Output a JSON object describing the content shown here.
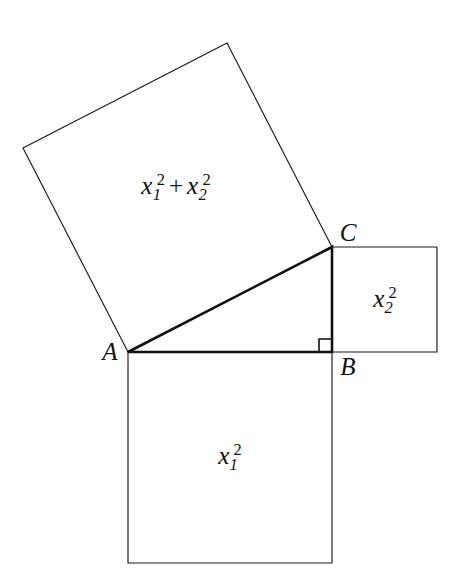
{
  "figure": {
    "background_color": "#ffffff",
    "line_color": "#1a1a1a",
    "width": 455,
    "height": 588
  },
  "vertices": {
    "a": {
      "label": "A",
      "x": 128,
      "y": 352,
      "label_x": 110,
      "label_y": 351
    },
    "b": {
      "label": "B",
      "x": 332,
      "y": 352,
      "label_x": 348,
      "label_y": 366
    },
    "c": {
      "label": "C",
      "x": 332,
      "y": 247,
      "label_x": 348,
      "label_y": 232
    }
  },
  "squares": {
    "hypotenuse": {
      "name": "square-on-hypotenuse",
      "area_label": "x₁² + x₂²",
      "points": "128,352 23,148 227,43 332,247",
      "label_x": 176,
      "label_y": 187
    },
    "leg_vertical": {
      "name": "square-on-vertical-leg",
      "area_label": "x₂²",
      "points": "332,247 437,247 437,352 332,352",
      "label_x": 385,
      "label_y": 300
    },
    "leg_horizontal": {
      "name": "square-on-horizontal-leg",
      "area_label": "x₁²",
      "points": "128,352 332,352 332,563 128,563",
      "label_x": 230,
      "label_y": 457
    }
  },
  "triangle": {
    "name": "right-triangle-ABC",
    "points": "128,352 332,352 332,247",
    "right_angle_at": "B",
    "right_angle_mark": "319,352 319,339 332,339"
  },
  "math_labels": {
    "hyp": {
      "term1_var": "x",
      "term1_sub": "1",
      "term1_sup": "2",
      "operator": "+",
      "term2_var": "x",
      "term2_sub": "2",
      "term2_sup": "2"
    },
    "leg2": {
      "var": "x",
      "sub": "2",
      "sup": "2"
    },
    "leg1": {
      "var": "x",
      "sub": "1",
      "sup": "2"
    }
  }
}
